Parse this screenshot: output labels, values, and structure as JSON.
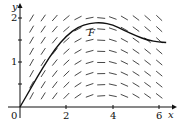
{
  "chart_data": {
    "type": "line",
    "title": "",
    "xlabel": "x",
    "ylabel": "y",
    "xlim": [
      0,
      6.5
    ],
    "ylim": [
      0,
      2.15
    ],
    "x_ticks": [
      0,
      2,
      4,
      6
    ],
    "x_tick_labels": [
      "0",
      "2",
      "4",
      "6"
    ],
    "y_ticks": [
      1,
      2
    ],
    "y_tick_labels": [
      "1",
      "2"
    ],
    "grid": false,
    "legend": null,
    "annotations": [
      {
        "text": "F",
        "x": 3.2,
        "y": 1.7
      }
    ],
    "slope_field": {
      "description": "direction field with steep positive slopes near x=0, flattening near x≈3.5, slightly negative beyond",
      "x_spacing": 0.5,
      "y_spacing": 0.25
    },
    "series": [
      {
        "name": "F",
        "x": [
          0,
          0.5,
          1,
          1.5,
          2,
          2.5,
          3,
          3.5,
          4,
          4.5,
          5,
          5.5,
          6,
          6.3
        ],
        "y": [
          0,
          0.45,
          0.9,
          1.3,
          1.6,
          1.8,
          1.88,
          1.9,
          1.85,
          1.72,
          1.6,
          1.5,
          1.46,
          1.45
        ]
      }
    ]
  },
  "labels": {
    "x_axis": "x",
    "y_axis": "y",
    "origin": "0",
    "x2": "2",
    "x4": "4",
    "x6": "6",
    "y1": "1",
    "y2": "2",
    "curve": "F"
  }
}
